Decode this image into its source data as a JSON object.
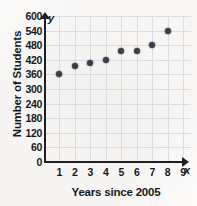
{
  "chart_data": {
    "type": "scatter",
    "title": "",
    "xlabel": "Years since 2005",
    "ylabel": "Number of Students",
    "xlim": [
      0,
      9.5
    ],
    "ylim": [
      0,
      600
    ],
    "grid": true,
    "legend": null,
    "x_ticks": [
      1,
      2,
      3,
      4,
      5,
      6,
      7,
      8,
      9
    ],
    "y_ticks": [
      0,
      60,
      120,
      180,
      240,
      300,
      360,
      420,
      480,
      540,
      600
    ],
    "x": [
      1,
      2,
      3,
      4,
      5,
      6,
      7,
      8
    ],
    "values": [
      360,
      395,
      405,
      420,
      458,
      458,
      480,
      537
    ],
    "points": [
      {
        "x": 1,
        "y": 360
      },
      {
        "x": 2,
        "y": 395
      },
      {
        "x": 3,
        "y": 405
      },
      {
        "x": 4,
        "y": 420
      },
      {
        "x": 5,
        "y": 458
      },
      {
        "x": 6,
        "y": 458
      },
      {
        "x": 7,
        "y": 480
      },
      {
        "x": 8,
        "y": 537
      }
    ],
    "marker_color": "#3a3f4a",
    "grid_color": "#d7dde2",
    "axis_color": "#1c1f24"
  },
  "axes": {
    "y_symbol": "y",
    "x_symbol": "x",
    "y_title": "Number of Students",
    "x_title": "Years since 2005"
  }
}
